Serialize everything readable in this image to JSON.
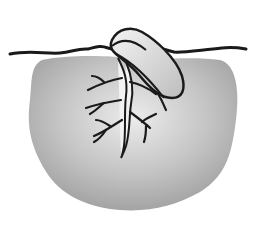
{
  "diagram": {
    "parts": [
      "ground-line",
      "soil-mass",
      "seed",
      "primary-root",
      "lateral-roots"
    ],
    "colors": {
      "background": "#ffffff",
      "soil_light": "#e8e8e8",
      "soil_dark": "#a9a9a9",
      "line": "#1a1a1a",
      "seed_fill": "#dcdcdc",
      "root_fill": "#f2f2f2"
    }
  }
}
